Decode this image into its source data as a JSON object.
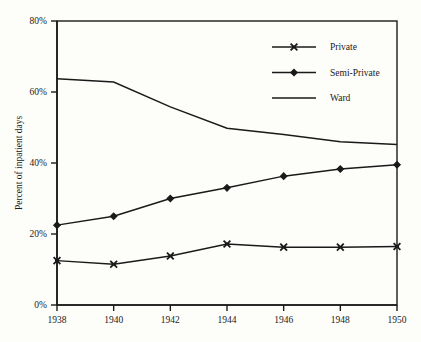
{
  "chart_data": {
    "type": "line",
    "title": "",
    "subtitle": "",
    "xlabel": "",
    "ylabel": "Percent of inpatient days",
    "x": [
      1938,
      1940,
      1942,
      1944,
      1946,
      1948,
      1950
    ],
    "xtick_labels": [
      "1938",
      "1940",
      "1942",
      "1944",
      "1946",
      "1948",
      "1950"
    ],
    "ytick_labels": [
      "0%",
      "20%",
      "40%",
      "60%",
      "80%"
    ],
    "ytick_values": [
      0,
      20,
      40,
      60,
      80
    ],
    "ylim": [
      0,
      80
    ],
    "xlim": [
      1938,
      1950
    ],
    "grid": false,
    "legend_position": "top-right",
    "series": [
      {
        "name": "Private",
        "marker": "x-cross",
        "values": [
          12.5,
          11.5,
          13.8,
          17.2,
          16.3,
          16.3,
          16.5
        ]
      },
      {
        "name": "Semi-Private",
        "marker": "filled-diamond",
        "values": [
          22.5,
          25.0,
          30.0,
          33.0,
          36.3,
          38.3,
          39.5
        ]
      },
      {
        "name": "Ward",
        "marker": "none",
        "values": [
          63.7,
          62.8,
          55.8,
          49.8,
          48.0,
          46.0,
          45.2
        ]
      }
    ]
  },
  "axis": {
    "y_title": "Percent of inpatient days"
  },
  "legend": {
    "entries": [
      {
        "label": "Private"
      },
      {
        "label": "Semi-Private"
      },
      {
        "label": "Ward"
      }
    ]
  },
  "colors": {
    "ink": "#1a1a1a",
    "background": "#fdfdfa"
  }
}
